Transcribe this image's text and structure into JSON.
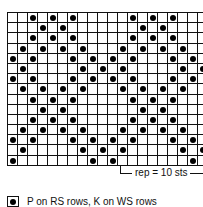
{
  "chart": {
    "columns": 20,
    "rows": [
      [
        2,
        4,
        6,
        12,
        14,
        16
      ],
      [
        3,
        5,
        13,
        15
      ],
      [
        2,
        4,
        6,
        12,
        14,
        16
      ],
      [
        1,
        3,
        5,
        7,
        11,
        13,
        15,
        17
      ],
      [
        0,
        2,
        6,
        8,
        10,
        12,
        16,
        18
      ],
      [
        1,
        7,
        9,
        11,
        17,
        19
      ],
      [
        0,
        2,
        6,
        8,
        10,
        12,
        16,
        18
      ],
      [
        1,
        3,
        5,
        7,
        11,
        13,
        15,
        17
      ],
      [
        2,
        4,
        6,
        12,
        14,
        16
      ],
      [
        3,
        5,
        13,
        15
      ],
      [
        2,
        4,
        6,
        12,
        14,
        16
      ],
      [
        1,
        3,
        5,
        7,
        11,
        13,
        15,
        17
      ],
      [
        0,
        2,
        6,
        8,
        10,
        12,
        16,
        18
      ],
      [
        1,
        7,
        9,
        11,
        17,
        19
      ],
      [
        0,
        8,
        10,
        18
      ]
    ]
  },
  "repeat": {
    "label": "rep = 10 sts"
  },
  "legend": {
    "symbol": "filled-dot",
    "text": "P on RS rows, K on WS rows"
  }
}
